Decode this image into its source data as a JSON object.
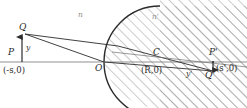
{
  "figure": {
    "type": "optics-ray-diagram",
    "width": 247,
    "height": 108,
    "background": "#ffffff",
    "ink_color": "#2b2b2b",
    "hatch_color": "#9b9b9b",
    "axis_color": "#8f8f8f"
  },
  "labels": {
    "object_point_top": "Q",
    "object_point_axis": "P",
    "object_coord": "(-s,0)",
    "object_height": "y",
    "vertex": "O",
    "center": "C",
    "center_coord": "(R,0)",
    "image_point_axis": "P'",
    "image_point_bottom": "Q'",
    "image_coord": "(s',0)",
    "image_height": "y'",
    "index_left": "n",
    "index_right": "n'"
  },
  "geometry": {
    "axis_y": 62,
    "vertex_x": 104,
    "center_x": 160,
    "sphere_radius": 56,
    "object_x": 22,
    "object_top_y": 34,
    "image_x": 213,
    "image_bottom_y": 72
  },
  "optics_data": {
    "media": [
      {
        "name": "n",
        "side": "left",
        "region": "unshaded"
      },
      {
        "name": "n'",
        "side": "right",
        "region": "hatched"
      }
    ],
    "points": [
      {
        "name": "Q",
        "role": "object-tip",
        "on_axis": false
      },
      {
        "name": "P",
        "role": "object-base",
        "on_axis": true,
        "coordinate": "(-s,0)"
      },
      {
        "name": "O",
        "role": "vertex",
        "on_axis": true,
        "coordinate": "(0,0)"
      },
      {
        "name": "C",
        "role": "center-of-curvature",
        "on_axis": true,
        "coordinate": "(R,0)"
      },
      {
        "name": "P'",
        "role": "image-base",
        "on_axis": true,
        "coordinate": "(s',0)"
      },
      {
        "name": "Q'",
        "role": "image-tip",
        "on_axis": false
      }
    ],
    "heights": [
      {
        "symbol": "y",
        "belongs_to": "object",
        "direction": "up"
      },
      {
        "symbol": "y'",
        "belongs_to": "image",
        "direction": "down"
      }
    ],
    "rays": [
      {
        "from": "Q",
        "through": "O",
        "to": "Q'",
        "description": "ray striking vertex"
      },
      {
        "from": "Q",
        "through": "surface-upper",
        "to": "Q'",
        "description": "refracted marginal ray"
      },
      {
        "from": "C",
        "to": "surface",
        "description": "optical axis through center of curvature"
      }
    ],
    "surface": {
      "shape": "convex-spherical",
      "vertex": "O",
      "center": "C",
      "radius_symbol": "R"
    }
  }
}
